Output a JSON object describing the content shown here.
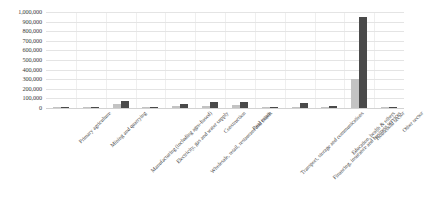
{
  "chart_data": {
    "type": "bar",
    "title": "",
    "subtitle": "",
    "xlabel": "",
    "ylabel": "",
    "ylim": [
      0,
      1000000
    ],
    "grid": true,
    "legend": "none",
    "y_ticks": [
      "1,000,000",
      "900,000",
      "800,000",
      "700,000",
      "600,000",
      "500,000",
      "400,000",
      "300,000",
      "200,000",
      "100,000",
      "0"
    ],
    "y_tick_values": [
      1000000,
      900000,
      800000,
      700000,
      600000,
      500000,
      400000,
      300000,
      200000,
      100000,
      0
    ],
    "categories": [
      "Primary agriculture",
      "Mining and quarrying",
      "Manufacturing (including agro-based)",
      "Electricity, gas and water supply",
      "Wholesale, retail, restaurant and hotels",
      "Construction",
      "Real estate",
      "Transport, storage and communications",
      "Financing, insurance and business services",
      "Education, health & others",
      "Household sector",
      "Other sector"
    ],
    "series": [
      {
        "name": "series-1",
        "color": "#c3c3c3",
        "values": [
          6000,
          3000,
          38000,
          5000,
          16000,
          16000,
          28000,
          6000,
          14000,
          4000,
          300000,
          3000
        ]
      },
      {
        "name": "series-2",
        "color": "#4a4a4a",
        "values": [
          14000,
          7000,
          70000,
          10000,
          38000,
          58000,
          62000,
          14000,
          48000,
          18000,
          950000,
          9000
        ]
      }
    ]
  }
}
